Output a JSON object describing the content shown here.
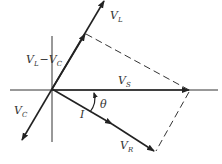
{
  "diagram": {
    "labels": {
      "vl": {
        "main": "V",
        "sub": "L"
      },
      "vlvc": {
        "main1": "V",
        "sub1": "L",
        "minus": "−",
        "main2": "V",
        "sub2": "C"
      },
      "vs": {
        "main": "V",
        "sub": "S"
      },
      "vc": {
        "main": "V",
        "sub": "C"
      },
      "vr": {
        "main": "V",
        "sub": "R"
      },
      "i": "I",
      "theta": "θ"
    },
    "phasors": [
      {
        "name": "V_L",
        "direction": "up-right",
        "role": "inductor voltage"
      },
      {
        "name": "V_L - V_C",
        "direction": "up-right",
        "role": "net reactive voltage"
      },
      {
        "name": "V_C",
        "direction": "down-left",
        "role": "capacitor voltage"
      },
      {
        "name": "V_S",
        "direction": "right",
        "role": "source voltage"
      },
      {
        "name": "I",
        "direction": "down-right",
        "role": "current"
      },
      {
        "name": "V_R",
        "direction": "down-right",
        "role": "resistor voltage, in phase with I"
      }
    ],
    "angle": {
      "name": "theta",
      "between": [
        "I",
        "V_S"
      ]
    }
  }
}
